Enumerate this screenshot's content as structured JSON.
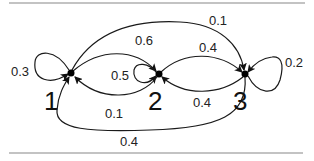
{
  "diagram": {
    "type": "markov-chain-state-transition",
    "nodes": [
      {
        "id": "1",
        "label": "1"
      },
      {
        "id": "2",
        "label": "2"
      },
      {
        "id": "3",
        "label": "3"
      }
    ],
    "edges": [
      {
        "from": "1",
        "to": "1",
        "label": "0.3"
      },
      {
        "from": "1",
        "to": "2",
        "label": "0.6"
      },
      {
        "from": "1",
        "to": "3",
        "label": "0.1"
      },
      {
        "from": "2",
        "to": "2",
        "label": "0.5"
      },
      {
        "from": "2",
        "to": "1",
        "label": "0.1"
      },
      {
        "from": "2",
        "to": "3",
        "label": "0.4"
      },
      {
        "from": "3",
        "to": "3",
        "label": "0.2"
      },
      {
        "from": "3",
        "to": "2",
        "label": "0.4"
      },
      {
        "from": "3",
        "to": "1",
        "label": "0.4"
      }
    ]
  }
}
